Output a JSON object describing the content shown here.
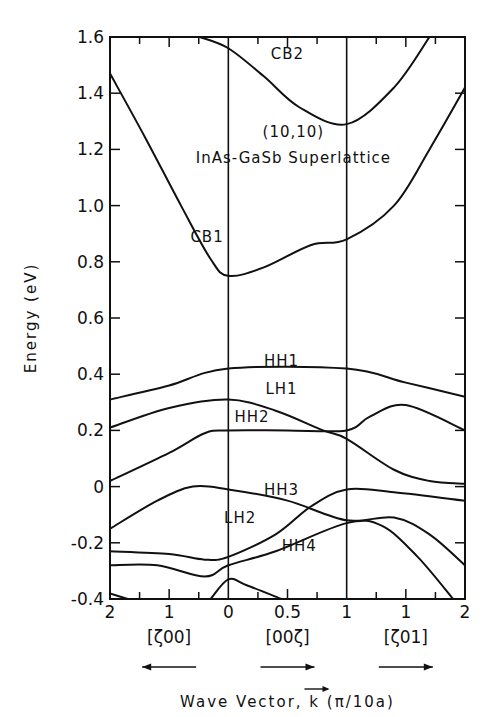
{
  "chart_data": {
    "type": "line",
    "title_lines": [
      "(10,10)",
      "InAs-GaSb Superlattice"
    ],
    "xlabel": "Wave Vector, k (π/10a)",
    "ylabel": "Energy (eV)",
    "ylim": [
      -0.4,
      1.6
    ],
    "yticks": [
      -0.4,
      -0.2,
      0,
      0.2,
      0.4,
      0.6,
      0.8,
      1.0,
      1.2,
      1.4,
      1.6
    ],
    "ytick_labels": [
      "-0.4",
      "-0.2",
      "0",
      "0.2",
      "0.4",
      "0.6",
      "0.8",
      "1.0",
      "1.2",
      "1.4",
      "1.6"
    ],
    "xtick_labels": [
      "2",
      "1",
      "0",
      "0.5",
      "1",
      "1",
      "2"
    ],
    "direction_labels": [
      {
        "label": "[ζ00]",
        "arrow": "left"
      },
      {
        "label": "[00ζ]",
        "arrow": "right"
      },
      {
        "label": "[ζ01]",
        "arrow": "right"
      }
    ],
    "grid": false,
    "legend": "inline band labels",
    "segments": [
      {
        "name": "[ζ00]",
        "k_range": [
          2,
          0
        ]
      },
      {
        "name": "[00ζ]",
        "k_range": [
          0,
          1
        ]
      },
      {
        "name": "[ζ01]",
        "k_range": [
          0,
          2
        ]
      }
    ],
    "x_param": "path position 0..3 (0 = k=2 [ζ00], 1 = Γ, 2 = end [00ζ], 3 = k=2 [ζ01])",
    "series": [
      {
        "name": "CB2",
        "points": [
          [
            0.76,
            1.6
          ],
          [
            1.0,
            1.56
          ],
          [
            1.3,
            1.46
          ],
          [
            1.6,
            1.35
          ],
          [
            2.0,
            1.29
          ],
          [
            2.4,
            1.42
          ],
          [
            2.7,
            1.6
          ]
        ]
      },
      {
        "name": "CB1",
        "points": [
          [
            0,
            1.47
          ],
          [
            0.3,
            1.24
          ],
          [
            0.6,
            1.0
          ],
          [
            0.85,
            0.81
          ],
          [
            1.0,
            0.75
          ],
          [
            1.3,
            0.78
          ],
          [
            1.7,
            0.86
          ],
          [
            2.0,
            0.88
          ],
          [
            2.4,
            1.0
          ],
          [
            2.7,
            1.2
          ],
          [
            3.0,
            1.42
          ]
        ]
      },
      {
        "name": "HH1",
        "points": [
          [
            0,
            0.31
          ],
          [
            0.5,
            0.36
          ],
          [
            1.0,
            0.42
          ],
          [
            2.0,
            0.42
          ],
          [
            2.5,
            0.37
          ],
          [
            3.0,
            0.32
          ]
        ]
      },
      {
        "name": "LH1",
        "points": [
          [
            0,
            0.21
          ],
          [
            0.5,
            0.28
          ],
          [
            1.0,
            0.31
          ],
          [
            1.4,
            0.27
          ],
          [
            1.8,
            0.2
          ],
          [
            2.0,
            0.17
          ],
          [
            2.4,
            0.06
          ],
          [
            2.7,
            0.02
          ],
          [
            3.0,
            0.01
          ]
        ]
      },
      {
        "name": "HH2",
        "points": [
          [
            0,
            0.02
          ],
          [
            0.5,
            0.12
          ],
          [
            0.8,
            0.19
          ],
          [
            1.0,
            0.2
          ],
          [
            1.5,
            0.2
          ],
          [
            2.0,
            0.2
          ],
          [
            2.2,
            0.25
          ],
          [
            2.5,
            0.29
          ],
          [
            3.0,
            0.2
          ]
        ]
      },
      {
        "name": "HH3",
        "points": [
          [
            0,
            -0.15
          ],
          [
            0.4,
            -0.05
          ],
          [
            0.7,
            0.0
          ],
          [
            1.0,
            -0.01
          ],
          [
            1.5,
            -0.05
          ],
          [
            2.0,
            -0.12
          ],
          [
            2.4,
            -0.11
          ],
          [
            2.7,
            -0.17
          ],
          [
            3.0,
            -0.28
          ]
        ]
      },
      {
        "name": "LH2",
        "points": [
          [
            0,
            -0.23
          ],
          [
            0.5,
            -0.24
          ],
          [
            0.8,
            -0.26
          ],
          [
            1.0,
            -0.25
          ],
          [
            1.4,
            -0.17
          ],
          [
            1.7,
            -0.07
          ],
          [
            2.0,
            -0.01
          ],
          [
            2.4,
            -0.02
          ],
          [
            3.0,
            -0.05
          ]
        ]
      },
      {
        "name": "HH4",
        "points": [
          [
            0,
            -0.28
          ],
          [
            0.4,
            -0.28
          ],
          [
            0.8,
            -0.32
          ],
          [
            1.0,
            -0.28
          ],
          [
            1.4,
            -0.23
          ],
          [
            2.0,
            -0.13
          ],
          [
            2.3,
            -0.14
          ],
          [
            2.6,
            -0.25
          ],
          [
            2.9,
            -0.4
          ]
        ]
      },
      {
        "name": "unlabeled-low",
        "points": [
          [
            0.85,
            -0.4
          ],
          [
            1.0,
            -0.33
          ],
          [
            1.15,
            -0.35
          ],
          [
            1.45,
            -0.4
          ]
        ]
      },
      {
        "name": "unlabeled-low-left",
        "points": [
          [
            0,
            -0.38
          ],
          [
            0.15,
            -0.4
          ]
        ]
      }
    ],
    "band_labels": [
      {
        "name": "CB2",
        "x": 1.5,
        "y": 1.52
      },
      {
        "name": "CB1",
        "x": 0.82,
        "y": 0.87
      },
      {
        "name": "HH1",
        "x": 1.45,
        "y": 0.43
      },
      {
        "name": "LH1",
        "x": 1.45,
        "y": 0.33
      },
      {
        "name": "HH2",
        "x": 1.2,
        "y": 0.23
      },
      {
        "name": "HH3",
        "x": 1.45,
        "y": -0.03
      },
      {
        "name": "LH2",
        "x": 1.1,
        "y": -0.13
      },
      {
        "name": "HH4",
        "x": 1.6,
        "y": -0.23
      }
    ]
  }
}
